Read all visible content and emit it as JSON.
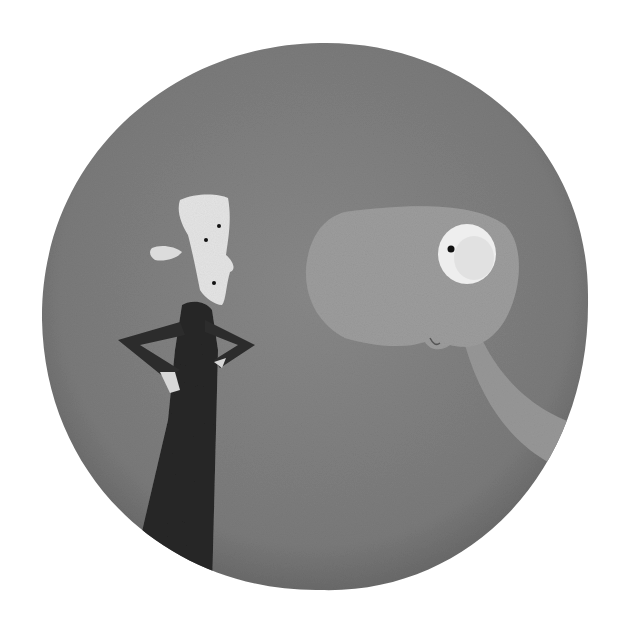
{
  "illustration": {
    "description": "Grayscale textured painting inside a circular disc: a tall thin character with a white pointed head and black coat, hands on hips, facing a large grey creature with a big round eye and long neck.",
    "colors": {
      "background": "#ffffff",
      "disc": "#7f7f7f",
      "disc_edge": "#6a6a6a",
      "creature": "#9a9a9a",
      "creature_highlight": "#a8a8a8",
      "eye_white": "#f2f2f2",
      "pupil": "#111111",
      "head": "#e6e6e6",
      "coat": "#2a2a2a"
    }
  }
}
